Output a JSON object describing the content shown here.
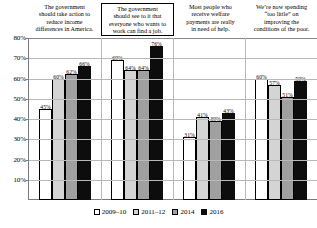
{
  "chart_data": {
    "type": "bar",
    "title": "",
    "xlabel": "",
    "ylabel": "",
    "ylim": [
      0,
      80
    ],
    "ytick_labels": [
      "80%",
      "70%",
      "60%",
      "50%",
      "40%",
      "30%",
      "20%",
      "10%"
    ],
    "ytick_values": [
      80,
      70,
      60,
      50,
      40,
      30,
      20,
      10
    ],
    "grid": true,
    "legend_position": "bottom",
    "categories": [
      "The government should take action to reduce income differences in America.",
      "The government should see to it that everyone who wants to work can find a job.",
      "Most people who receive welfare payments are really in need of help.",
      "We're now spending “too little” on improving the conditions of the poor."
    ],
    "category_lines": [
      [
        "The government",
        "should take action to",
        "reduce income",
        "differences in America."
      ],
      [
        "The government",
        "should see to it that",
        "everyone who wants to",
        "work can find a job."
      ],
      [
        "Most people who",
        "receive welfare",
        "payments are really",
        "in need of help."
      ],
      [
        "We’re now spending",
        "“too little” on",
        "improving the",
        "conditions of the poor."
      ]
    ],
    "category_boxed": [
      false,
      true,
      false,
      false
    ],
    "series": [
      {
        "name": "2009–10",
        "values": [
          45,
          69,
          31,
          60
        ],
        "labels": [
          "45%",
          "69%",
          "31%",
          "60%"
        ],
        "color": "#ffffff"
      },
      {
        "name": "2011–12",
        "values": [
          60,
          64,
          41,
          57
        ],
        "labels": [
          "60%",
          "64%",
          "41%",
          "57%"
        ],
        "color": "#d4d4d4"
      },
      {
        "name": "2014",
        "values": [
          62,
          64,
          39,
          51
        ],
        "labels": [
          "62%",
          "64%",
          "39%",
          "51%"
        ],
        "color": "#a0a0a0"
      },
      {
        "name": "2016",
        "values": [
          66,
          76,
          43,
          59
        ],
        "labels": [
          "66%",
          "76%",
          "43%",
          "59%"
        ],
        "color": "#0d0d0d"
      }
    ]
  },
  "legend": {
    "items": [
      {
        "label": "2009–10"
      },
      {
        "label": "2011–12"
      },
      {
        "label": "2014"
      },
      {
        "label": "2016"
      }
    ]
  }
}
